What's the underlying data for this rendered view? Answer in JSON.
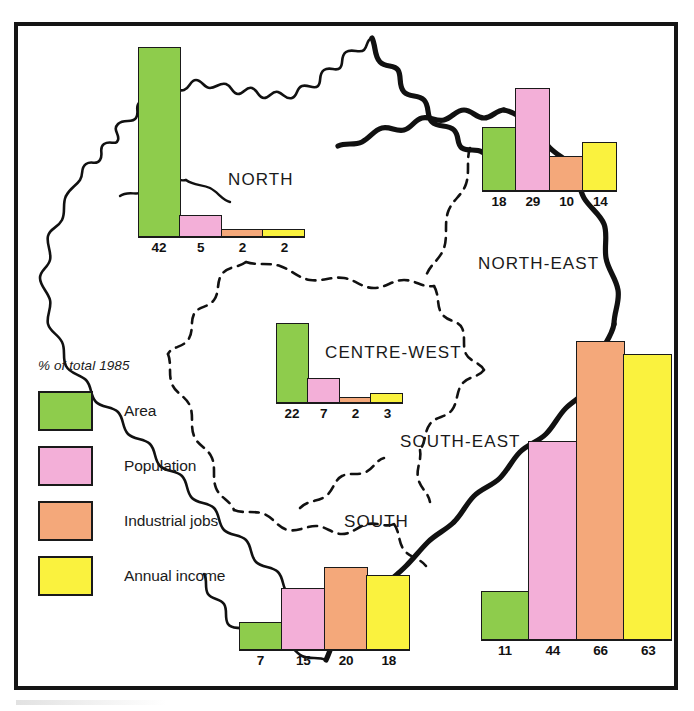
{
  "figure": {
    "title_visible": false,
    "legend": {
      "title": "% of total 1985",
      "items": [
        {
          "label": "Area",
          "color": "#8ECC4C",
          "key": "area"
        },
        {
          "label": "Population",
          "color": "#F3AFD8",
          "key": "population"
        },
        {
          "label": "Industrial jobs",
          "color": "#F4A87A",
          "key": "industrial_jobs"
        },
        {
          "label": "Annual income",
          "color": "#FAF23E",
          "key": "annual_income"
        }
      ]
    },
    "region_labels": [
      {
        "name": "NORTH"
      },
      {
        "name": "NORTH-EAST"
      },
      {
        "name": "CENTRE-WEST"
      },
      {
        "name": "SOUTH-EAST"
      },
      {
        "name": "SOUTH"
      }
    ]
  },
  "chart_data": {
    "type": "bar",
    "title": "% of total 1985",
    "subtitle": "Brazilian regions: share of national area, population, industrial jobs and annual income",
    "xlabel": "",
    "ylabel": "% of total 1985",
    "ylim": [
      0,
      70
    ],
    "grid": false,
    "legend_position": "left-middle",
    "categories": [
      "NORTH",
      "NORTH-EAST",
      "CENTRE-WEST",
      "SOUTH-EAST",
      "SOUTH"
    ],
    "series": [
      {
        "name": "Area",
        "color": "#8ECC4C",
        "values": [
          42,
          18,
          22,
          11,
          7
        ]
      },
      {
        "name": "Population",
        "color": "#F3AFD8",
        "values": [
          5,
          29,
          7,
          44,
          15
        ]
      },
      {
        "name": "Industrial jobs",
        "color": "#F4A87A",
        "values": [
          2,
          10,
          2,
          66,
          20
        ]
      },
      {
        "name": "Annual income",
        "color": "#FAF23E",
        "values": [
          2,
          14,
          3,
          63,
          18
        ]
      }
    ],
    "groups": [
      {
        "region": "NORTH",
        "bars": [
          {
            "series": "Area",
            "value": 42,
            "label": "42",
            "color": "#8ECC4C"
          },
          {
            "series": "Population",
            "value": 5,
            "label": "5",
            "color": "#F3AFD8"
          },
          {
            "series": "Industrial jobs",
            "value": 2,
            "label": "2",
            "color": "#F4A87A"
          },
          {
            "series": "Annual income",
            "value": 2,
            "label": "2",
            "color": "#FAF23E"
          }
        ]
      },
      {
        "region": "NORTH-EAST",
        "bars": [
          {
            "series": "Area",
            "value": 18,
            "label": "18",
            "color": "#8ECC4C"
          },
          {
            "series": "Population",
            "value": 29,
            "label": "29",
            "color": "#F3AFD8"
          },
          {
            "series": "Industrial jobs",
            "value": 10,
            "label": "10",
            "color": "#F4A87A"
          },
          {
            "series": "Annual income",
            "value": 14,
            "label": "14",
            "color": "#FAF23E"
          }
        ]
      },
      {
        "region": "CENTRE-WEST",
        "bars": [
          {
            "series": "Area",
            "value": 22,
            "label": "22",
            "color": "#8ECC4C"
          },
          {
            "series": "Population",
            "value": 7,
            "label": "7",
            "color": "#F3AFD8"
          },
          {
            "series": "Industrial jobs",
            "value": 2,
            "label": "2",
            "color": "#F4A87A"
          },
          {
            "series": "Annual income",
            "value": 3,
            "label": "3",
            "color": "#FAF23E"
          }
        ]
      },
      {
        "region": "SOUTH-EAST",
        "bars": [
          {
            "series": "Area",
            "value": 11,
            "label": "11",
            "color": "#8ECC4C"
          },
          {
            "series": "Population",
            "value": 44,
            "label": "44",
            "color": "#F3AFD8"
          },
          {
            "series": "Industrial jobs",
            "value": 66,
            "label": "66",
            "color": "#F4A87A"
          },
          {
            "series": "Annual income",
            "value": 63,
            "label": "63",
            "color": "#FAF23E"
          }
        ]
      },
      {
        "region": "SOUTH",
        "bars": [
          {
            "series": "Area",
            "value": 7,
            "label": "7",
            "color": "#8ECC4C"
          },
          {
            "series": "Population",
            "value": 15,
            "label": "15",
            "color": "#F3AFD8"
          },
          {
            "series": "Industrial jobs",
            "value": 20,
            "label": "20",
            "color": "#F4A87A"
          },
          {
            "series": "Annual income",
            "value": 18,
            "label": "18",
            "color": "#FAF23E"
          }
        ]
      }
    ]
  },
  "layout": {
    "groups": [
      {
        "region": "NORTH",
        "left": 138,
        "baseline": 238,
        "barWidth": 43,
        "scale": 4.55
      },
      {
        "region": "NORTH-EAST",
        "left": 482,
        "baseline": 192,
        "barWidth": 35,
        "scale": 3.6
      },
      {
        "region": "CENTRE-WEST",
        "left": 276,
        "baseline": 404,
        "barWidth": 33,
        "scale": 3.7
      },
      {
        "region": "SOUTH-EAST",
        "left": 481,
        "baseline": 641,
        "barWidth": 49,
        "scale": 4.55
      },
      {
        "region": "SOUTH",
        "left": 239,
        "baseline": 651,
        "barWidth": 44,
        "scale": 4.2
      }
    ],
    "region_label_pos": [
      {
        "name": "NORTH",
        "left": 228,
        "top": 170
      },
      {
        "name": "NORTH-EAST",
        "left": 478,
        "top": 254
      },
      {
        "name": "CENTRE-WEST",
        "left": 325,
        "top": 343
      },
      {
        "name": "SOUTH-EAST",
        "left": 400,
        "top": 432
      },
      {
        "name": "SOUTH",
        "left": 344,
        "top": 512
      }
    ]
  }
}
